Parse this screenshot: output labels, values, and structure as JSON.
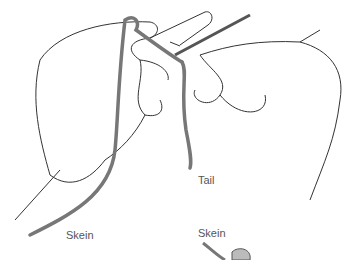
{
  "diagram": {
    "labels": {
      "tail": "Tail",
      "skein_left": "Skein",
      "skein_right": "Skein"
    },
    "colors": {
      "yarn": "#777777",
      "outline": "#333333"
    }
  }
}
